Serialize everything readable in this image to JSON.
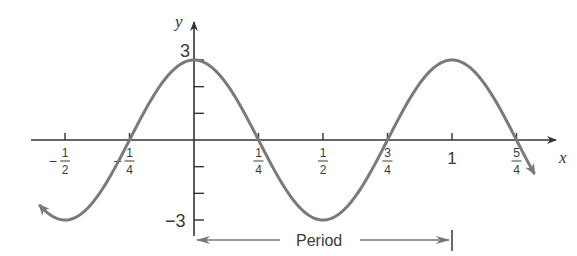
{
  "chart_data": {
    "type": "line",
    "title": "",
    "function": "y = 3cos(2πx)",
    "xlabel": "x",
    "ylabel": "y",
    "xlim": [
      -0.625,
      1.3
    ],
    "ylim": [
      -3,
      3
    ],
    "grid": false,
    "x_ticks": [
      {
        "value": -0.5,
        "sign": "−",
        "num": "1",
        "den": "2"
      },
      {
        "value": -0.25,
        "sign": "−",
        "num": "1",
        "den": "4"
      },
      {
        "value": 0.25,
        "sign": "",
        "num": "1",
        "den": "4"
      },
      {
        "value": 0.5,
        "sign": "",
        "num": "1",
        "den": "2"
      },
      {
        "value": 0.75,
        "sign": "",
        "num": "3",
        "den": "4"
      },
      {
        "value": 1,
        "sign": "",
        "num": "1",
        "den": ""
      },
      {
        "value": 1.25,
        "sign": "",
        "num": "5",
        "den": "4"
      }
    ],
    "y_ticks": [
      -3,
      -2,
      -1,
      0,
      1,
      2,
      3
    ],
    "y_tick_labels": [
      {
        "value": 3,
        "label": "3"
      },
      {
        "value": -3,
        "label": "−3"
      }
    ],
    "series": [
      {
        "name": "y = 3cos(2πx)",
        "x": [
          -0.6,
          -0.5,
          -0.375,
          -0.25,
          -0.125,
          0,
          0.125,
          0.25,
          0.375,
          0.5,
          0.625,
          0.75,
          0.875,
          1,
          1.125,
          1.25,
          1.32
        ],
        "values": [
          -2.43,
          -3,
          -2.12,
          0,
          2.12,
          3,
          2.12,
          0,
          -2.12,
          -3,
          -2.12,
          0,
          2.12,
          3,
          2.12,
          0,
          -1.27
        ],
        "color": "#7a7a7a"
      }
    ],
    "annotations": [
      {
        "type": "interval-arrow",
        "label": "Period",
        "from": 0,
        "to": 1
      }
    ]
  },
  "labels": {
    "x_axis": "x",
    "y_axis": "y",
    "y_max": "3",
    "y_min": "−3",
    "period": "Period"
  },
  "colors": {
    "curve": "#7a7a7a",
    "axis": "#333333",
    "arrow": "#777777"
  }
}
